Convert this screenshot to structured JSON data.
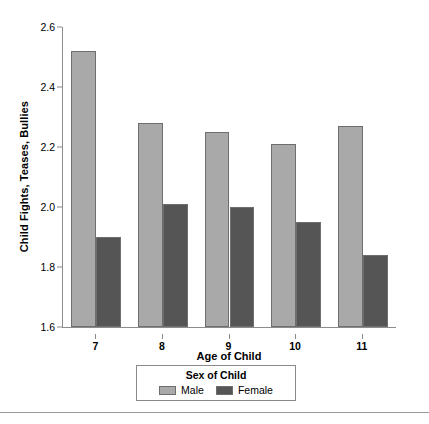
{
  "chart_data": {
    "type": "bar",
    "title": "",
    "xlabel": "Age of Child",
    "ylabel": "Child Fights, Teases, Bullies",
    "categories": [
      "7",
      "8",
      "9",
      "10",
      "11"
    ],
    "series": [
      {
        "name": "Male",
        "color": "#a9a9a9",
        "values": [
          2.52,
          2.28,
          2.25,
          2.21,
          2.27
        ]
      },
      {
        "name": "Female",
        "color": "#555555",
        "values": [
          1.9,
          2.01,
          2.0,
          1.95,
          1.84
        ]
      }
    ],
    "ylim": [
      1.6,
      2.6
    ],
    "yticks": [
      "1.6",
      "1.8",
      "2.0",
      "2.2",
      "2.4",
      "2.6"
    ],
    "ytick_values": [
      1.6,
      1.8,
      2.0,
      2.2,
      2.4,
      2.6
    ],
    "grid": false,
    "legend_position": "bottom",
    "legend_title": "Sex of Child"
  }
}
